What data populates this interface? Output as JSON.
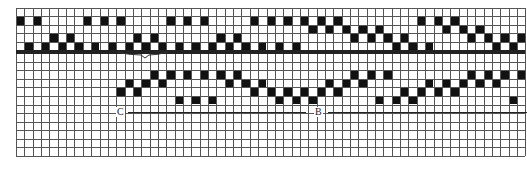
{
  "figure": {
    "type": "weaving-draft",
    "columns": 61,
    "grid": {
      "left": 16,
      "top": 8,
      "col_pitch": 8.35,
      "row_pitch": 8.4,
      "upper_rows": 5,
      "lower_top": 53,
      "lower_rows": 12,
      "bottom": 156,
      "line_color": "#555555",
      "fill_color": "#111111"
    },
    "upper_block": {
      "rows": [
        {
          "row": 0,
          "filled": []
        },
        {
          "row": 1,
          "filled": [
            0,
            2,
            8,
            10,
            12,
            18,
            20,
            22,
            28,
            30,
            32,
            34,
            36,
            38,
            48,
            50,
            52
          ]
        },
        {
          "row": 2,
          "filled": [
            35,
            37,
            39,
            41,
            43,
            51,
            53,
            55
          ]
        },
        {
          "row": 3,
          "filled": [
            4,
            6,
            14,
            16,
            24,
            26,
            40,
            42,
            44,
            46,
            54,
            56,
            58,
            60
          ]
        },
        {
          "row": 4,
          "filled": [
            1,
            3,
            5,
            7,
            9,
            11,
            13,
            15,
            17,
            19,
            21,
            23,
            25,
            27,
            29,
            31,
            33,
            45,
            47,
            49,
            57,
            59
          ]
        }
      ]
    },
    "lower_block": {
      "rows": [
        {
          "row": 2,
          "filled": [
            16,
            18,
            20,
            22,
            24,
            26,
            40,
            42,
            44,
            54,
            56,
            58,
            60
          ]
        },
        {
          "row": 3,
          "filled": [
            13,
            15,
            17,
            25,
            27,
            29,
            37,
            39,
            41,
            49,
            51,
            53,
            55,
            57
          ]
        },
        {
          "row": 4,
          "filled": [
            12,
            14,
            28,
            30,
            32,
            34,
            36,
            38,
            46,
            48,
            50,
            52
          ]
        },
        {
          "row": 5,
          "filled": [
            19,
            21,
            23,
            31,
            33,
            35,
            43,
            45,
            47,
            59
          ]
        }
      ]
    },
    "labels": [
      {
        "text": "C",
        "x": 116,
        "y": 107
      },
      {
        "text": "B",
        "x": 314,
        "y": 107
      }
    ],
    "rules": [
      {
        "name": "c-line",
        "x1": 128,
        "x2": 306,
        "y": 112
      },
      {
        "name": "b-line",
        "x1": 328,
        "x2": 527,
        "y": 112
      }
    ],
    "brace": {
      "x1": 118,
      "x2": 168,
      "y": 53,
      "tip_x": 145
    }
  }
}
